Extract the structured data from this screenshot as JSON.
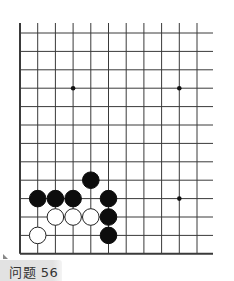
{
  "board": {
    "grid": {
      "origin_x": 20,
      "origin_y": 33,
      "spacing_x": 17.7,
      "spacing_y": 18.4,
      "cols": 11,
      "rows": 13,
      "right_extent": 213,
      "top_extent": 23,
      "line_color": "#3a3a3a"
    },
    "star_points": [
      [
        3,
        3
      ],
      [
        9,
        3
      ],
      [
        9,
        9
      ]
    ],
    "stones": [
      {
        "color": "black",
        "col": 4,
        "row": 8
      },
      {
        "color": "black",
        "col": 1,
        "row": 9
      },
      {
        "color": "black",
        "col": 2,
        "row": 9
      },
      {
        "color": "black",
        "col": 3,
        "row": 9
      },
      {
        "color": "black",
        "col": 5,
        "row": 9
      },
      {
        "color": "white",
        "col": 2,
        "row": 10
      },
      {
        "color": "white",
        "col": 3,
        "row": 10
      },
      {
        "color": "white",
        "col": 4,
        "row": 10
      },
      {
        "color": "black",
        "col": 5,
        "row": 10
      },
      {
        "color": "white",
        "col": 1,
        "row": 11
      },
      {
        "color": "black",
        "col": 5,
        "row": 11
      }
    ]
  },
  "problem_label": "问题 56"
}
